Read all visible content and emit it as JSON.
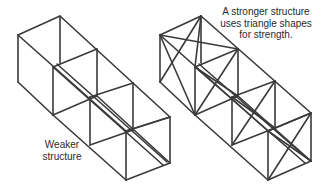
{
  "labels": {
    "weaker": [
      "Weaker",
      "structure"
    ],
    "stronger": [
      "A stronger structure",
      "uses triangle shapes",
      "for strength."
    ]
  },
  "colors": {
    "stroke": "#3a3a3a",
    "background": "#ffffff",
    "text": "#2a2a2a"
  },
  "structures": [
    {
      "name": "weaker-structure",
      "braced": false,
      "modules": 3
    },
    {
      "name": "stronger-structure",
      "braced": true,
      "modules": 3
    }
  ]
}
